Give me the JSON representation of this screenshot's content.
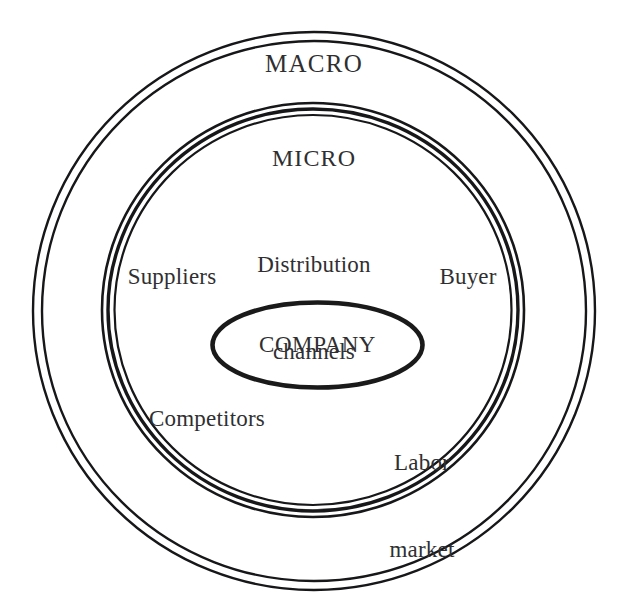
{
  "diagram": {
    "type": "concentric-circles",
    "colors": {
      "stroke": "#1a1a1a",
      "text": "#2f2f31",
      "background": "#ffffff"
    },
    "rings": [
      {
        "id": "macro",
        "label": "MACRO",
        "level": 1,
        "style": "double-thin-circle",
        "center": [
          314,
          311
        ],
        "radius": 278
      },
      {
        "id": "micro",
        "label": "MICRO",
        "level": 2,
        "style": "triple-thick-circle",
        "center": [
          313,
          310
        ],
        "radius": 208
      },
      {
        "id": "company",
        "label": "COMPANY",
        "level": 3,
        "style": "thick-ellipse",
        "center": [
          317,
          345
        ],
        "radius_x": 106,
        "radius_y": 43
      }
    ],
    "micro_factors": [
      {
        "id": "distribution-channels",
        "line1": "Distribution",
        "line2": "channels",
        "position": "top-center"
      },
      {
        "id": "suppliers",
        "line1": "Suppliers",
        "line2": "",
        "position": "left"
      },
      {
        "id": "buyer",
        "line1": "Buyer",
        "line2": "",
        "position": "right"
      },
      {
        "id": "competitors",
        "line1": "Competitors",
        "line2": "",
        "position": "bottom-left"
      },
      {
        "id": "labor-market",
        "line1": "Labor",
        "line2": "market",
        "position": "bottom-right"
      }
    ]
  }
}
